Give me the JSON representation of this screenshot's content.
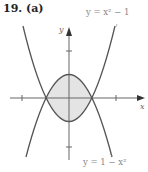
{
  "figure": {
    "problem_label": "19.",
    "part_label": "(a)",
    "upper_curve_label": "y = x² − 1",
    "lower_curve_label": "y = 1 − x²",
    "x_axis_label": "x",
    "y_axis_label": "y",
    "colors": {
      "curve": "#555555",
      "axis": "#666666",
      "fill": "#e4e4e4"
    }
  }
}
